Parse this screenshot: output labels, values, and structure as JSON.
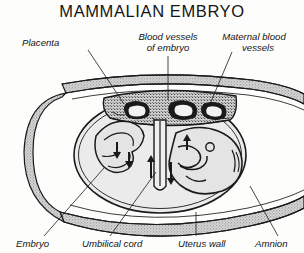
{
  "figure": {
    "title": "MAMMALIAN  EMBRYO",
    "background_color": "#fdfdfc",
    "ink_color": "#1a1a1a"
  },
  "labels": [
    {
      "id": "placenta",
      "text": "Placenta",
      "x": 22,
      "y": 46,
      "anchor": "start"
    },
    {
      "id": "blood-vessels-1",
      "text": "Blood vessels",
      "x": 168,
      "y": 40,
      "anchor": "middle"
    },
    {
      "id": "blood-vessels-2",
      "text": "of embryo",
      "x": 168,
      "y": 51,
      "anchor": "middle"
    },
    {
      "id": "maternal-1",
      "text": "Maternal blood",
      "x": 254,
      "y": 40,
      "anchor": "middle"
    },
    {
      "id": "maternal-2",
      "text": "vessels",
      "x": 258,
      "y": 51,
      "anchor": "middle"
    },
    {
      "id": "embryo",
      "text": "Embryo",
      "x": 16,
      "y": 247,
      "anchor": "start"
    },
    {
      "id": "umbilical-cord",
      "text": "Umbilical  cord",
      "x": 82,
      "y": 247,
      "anchor": "start"
    },
    {
      "id": "uterus-wall",
      "text": "Uterus wall",
      "x": 178,
      "y": 247,
      "anchor": "start"
    },
    {
      "id": "amnion",
      "text": "Amnion",
      "x": 255,
      "y": 247,
      "anchor": "start"
    }
  ],
  "structures": [
    {
      "id": "uterus-wall-band",
      "name": "Uterus wall",
      "fill": "#c9c9c9"
    },
    {
      "id": "amnion-sac",
      "name": "Amnion",
      "fill": "#ebebeb"
    },
    {
      "id": "placenta-body",
      "name": "Placenta",
      "fill": "#d4d4d4"
    },
    {
      "id": "embryo-body",
      "name": "Embryo",
      "fill": "#e4e4e4"
    },
    {
      "id": "umbilical-cord-body",
      "name": "Umbilical cord",
      "fill": "#efefef"
    },
    {
      "id": "embryo-vessels",
      "name": "Blood vessels of embryo",
      "fill": "#1a1a1a"
    },
    {
      "id": "maternal-vessels",
      "name": "Maternal blood vessels",
      "fill": "#1a1a1a"
    }
  ]
}
